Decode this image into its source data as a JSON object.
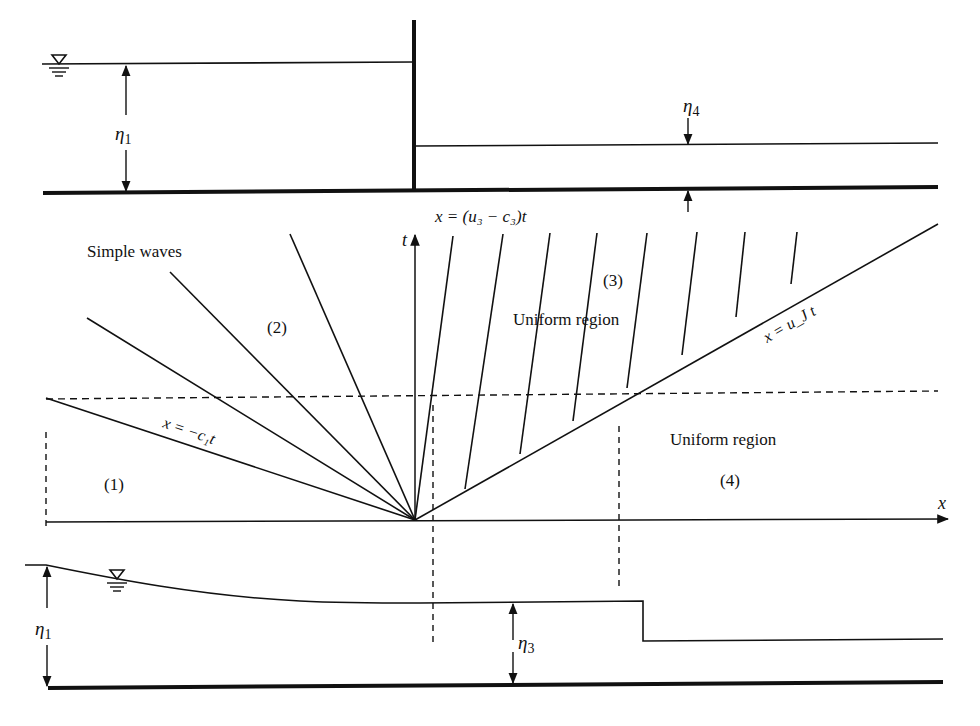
{
  "figure": {
    "top_panel": {
      "label_eta1": "η",
      "label_eta1_sub": "1",
      "label_eta4": "η",
      "label_eta4_sub": "4",
      "water_symbol": "free-surface-symbol"
    },
    "characteristic_plane": {
      "axis_t": "t",
      "axis_x": "x",
      "label_simple_waves": "Simple waves",
      "label_region1": "(1)",
      "label_region2": "(2)",
      "label_region3": "(3)",
      "label_region4": "(4)",
      "label_uniform_region_3": "Uniform region",
      "label_uniform_region_4": "Uniform region",
      "label_head_characteristic": "x = −c₁t",
      "label_tail_characteristic": "x = (u₃ − c₃)t",
      "label_bore": "x = u_J t"
    },
    "bottom_panel": {
      "label_eta1": "η",
      "label_eta1_sub": "1",
      "label_eta3": "η",
      "label_eta3_sub": "3",
      "water_symbol": "free-surface-symbol"
    }
  }
}
